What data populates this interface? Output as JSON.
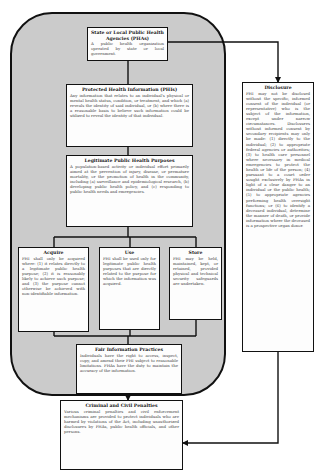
{
  "diagram": {
    "region": {
      "label": ""
    },
    "nodes": {
      "phas": {
        "title": "State or Local Public Health Agencies (PHAs)",
        "body": "A public health organization operated by state or local government."
      },
      "phi": {
        "title": "Protected Health Information (PHIs)",
        "body": "Any information that relates to an individual's physical or mental health status, condition, or treatment, and which (a) reveals the identity of said individual, or (b) where there is a reasonable basis to believe such information could be utilized to reveal the identity of that individual."
      },
      "legit": {
        "title": "Legitimate Public Health Purposes",
        "body": "A population-based activity or individual effort primarily aimed at the prevention of injury, disease, or premature mortality, or the promotion of health in the community, including (a) surveillance and epidemiological research, (b) developing public health policy, and (c) responding to public health needs and emergencies."
      },
      "acquire": {
        "title": "Acquire",
        "body": "PHI shall only be acquired where: (1) it relates directly to a legitimate public health purpose; (2) it is reasonably likely to achieve such purpose; and (3) the purpose cannot otherwise be achieved with non-identifiable information."
      },
      "use": {
        "title": "Use",
        "body": "PHI shall be used only for legitimate public health purposes that are directly related to the purpose for which the information was acquired."
      },
      "store": {
        "title": "Store",
        "body": "PHI may be held, maintained, kept, or retained, provided physical and technical security safeguards are undertaken."
      },
      "fair": {
        "title": "Fair Information Practices",
        "body": "Individuals have the right to access, inspect, copy, and amend their PHI subject to reasonable limitations. PHAs have the duty to maintain the accuracy of the information."
      },
      "criminal": {
        "title": "Criminal and Civil Penalties",
        "body": "Various criminal penalties and civil enforcement mechanisms are provided to protect individuals who are harmed by violations of the Act, including unauthorized disclosures by PHAs, public health officials, and other persons."
      },
      "disclosure": {
        "title": "Disclosure",
        "body": "PHI may not be disclosed without the specific, informed consent of the individual (or representative) who is the subject of the information, except under narrow circumstances. Disclosures without informed consent by secondary recipients may only be made: (1) directly to the individual; (2) to appropriate federal agencies or authorities; (3) to health care personnel where necessary in medical emergencies to protect the health or life of the person; (4) pursuant to a court order sought exclusively by PHAs in light of a clear danger to an individual or the public health; (5) to appropriate agencies performing health oversight functions; or (6) to identify a deceased individual, determine the manner of death, or provide information where the deceased is a prospective organ donor."
      }
    },
    "edges": [
      {
        "from": "phas",
        "to": "phi"
      },
      {
        "from": "phi",
        "to": "legit"
      },
      {
        "from": "legit",
        "to": "acquire"
      },
      {
        "from": "legit",
        "to": "use"
      },
      {
        "from": "legit",
        "to": "store"
      },
      {
        "from": "acquire",
        "to": "fair"
      },
      {
        "from": "use",
        "to": "fair"
      },
      {
        "from": "store",
        "to": "fair"
      },
      {
        "from": "phas",
        "to": "disclosure",
        "arrow": true
      },
      {
        "from": "region",
        "to": "criminal",
        "arrow": true
      },
      {
        "from": "disclosure",
        "to": "criminal",
        "arrow": true
      }
    ],
    "colors": {
      "region_fill": "#cbcbcb",
      "box_fill": "#fdfdfd",
      "stroke": "#111111"
    }
  }
}
